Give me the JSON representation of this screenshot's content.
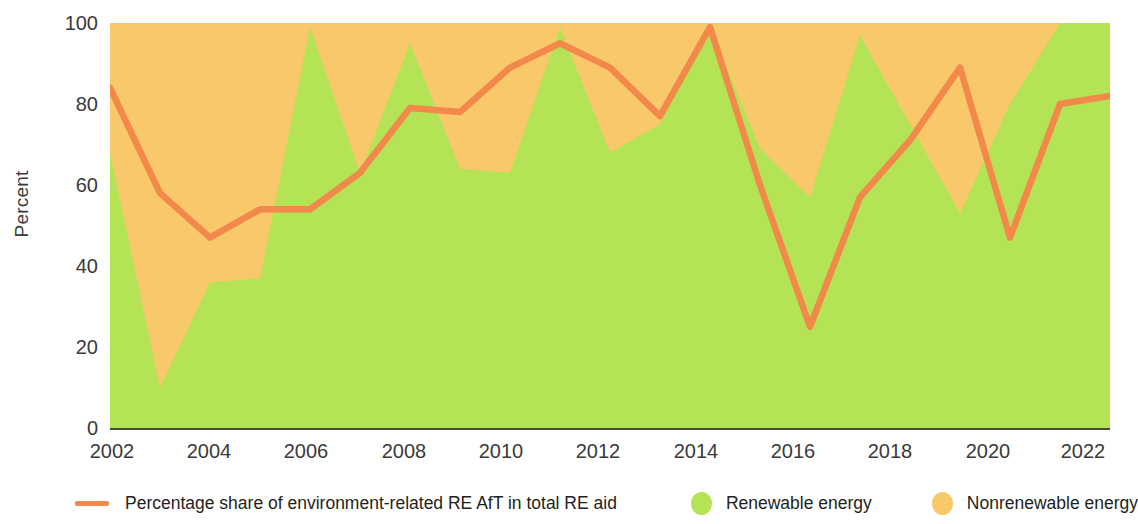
{
  "chart_data": {
    "type": "area",
    "title": "",
    "subtitle": "",
    "xlabel": "",
    "ylabel": "Percent",
    "ylim": [
      0,
      100
    ],
    "xlim": [
      2002,
      2022
    ],
    "grid": false,
    "legend_position": "bottom",
    "stacked": true,
    "x": [
      2002,
      2003,
      2004,
      2005,
      2006,
      2007,
      2008,
      2009,
      2010,
      2011,
      2012,
      2013,
      2014,
      2015,
      2016,
      2017,
      2018,
      2019,
      2020,
      2021,
      2022
    ],
    "y_ticks": [
      0,
      20,
      40,
      60,
      80,
      100
    ],
    "x_ticks": [
      2002,
      2004,
      2006,
      2008,
      2010,
      2012,
      2014,
      2016,
      2018,
      2020,
      2022
    ],
    "series": [
      {
        "name": "Renewable energy",
        "type": "area",
        "color": "#b5e356",
        "values": [
          68,
          10,
          36,
          37,
          99,
          63,
          95,
          64,
          63,
          99,
          68,
          75,
          99,
          69,
          57,
          97,
          75,
          53,
          80,
          100,
          100
        ]
      },
      {
        "name": "Nonrenewable energy",
        "type": "area",
        "color": "#f9c86a",
        "values": [
          32,
          90,
          64,
          63,
          1,
          37,
          5,
          36,
          37,
          1,
          32,
          25,
          1,
          31,
          43,
          3,
          25,
          47,
          20,
          0,
          0
        ]
      },
      {
        "name": "Percentage share of environment-related RE AfT in total RE aid",
        "type": "line",
        "color": "#f3884b",
        "values": [
          84,
          58,
          47,
          54,
          54,
          63,
          79,
          78,
          89,
          95,
          89,
          77,
          99,
          60,
          25,
          57,
          71,
          89,
          47,
          80,
          82
        ]
      }
    ]
  },
  "axes": {
    "y_title": "Percent",
    "y_tick_labels": [
      "100",
      "80",
      "60",
      "40",
      "20",
      "0"
    ],
    "x_tick_labels": [
      "2002",
      "2004",
      "2006",
      "2008",
      "2010",
      "2012",
      "2014",
      "2016",
      "2018",
      "2020",
      "2022"
    ]
  },
  "legend": {
    "line_label": "Percentage share of environment-related RE AfT in total RE aid",
    "renewable_label": "Renewable energy",
    "nonrenewable_label": "Nonrenewable energy"
  },
  "colors": {
    "line": "#f3884b",
    "renewable": "#b5e356",
    "nonrenewable": "#f9c86a",
    "axis": "#4a4a33",
    "text": "#3a3a3a"
  }
}
